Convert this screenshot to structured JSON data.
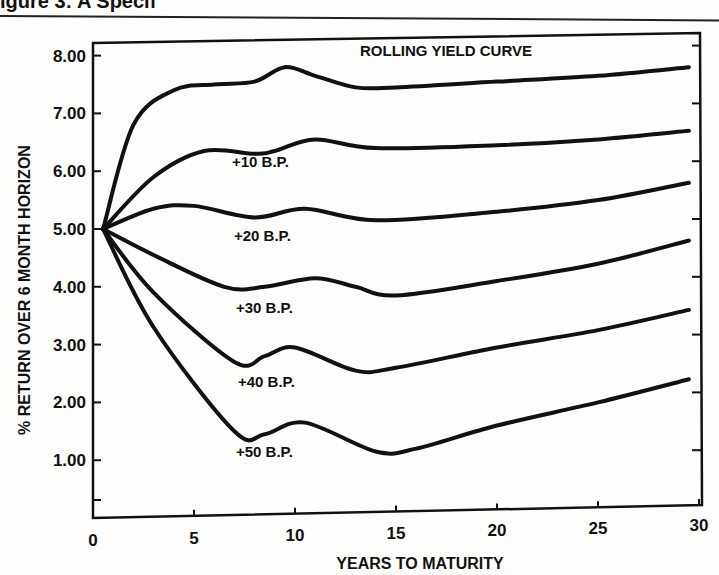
{
  "heading": {
    "text": "igure 3: A Specif"
  },
  "chart_data": {
    "type": "line",
    "title": "",
    "xlabel": "YEARS TO MATURITY",
    "ylabel": "% RETURN OVER 6 MONTH HORIZON",
    "xlim": [
      0,
      30
    ],
    "ylim": [
      0,
      8.5
    ],
    "x_ticks": [
      "0",
      "5",
      "10",
      "15",
      "20",
      "25",
      "30"
    ],
    "y_ticks": [
      "1.00",
      "2.00",
      "3.00",
      "4.00",
      "5.00",
      "6.00",
      "7.00",
      "8.00"
    ],
    "grid": false,
    "legend": "inline labels",
    "series": [
      {
        "name": "ROLLING YIELD CURVE",
        "x": [
          0.5,
          2,
          4,
          6,
          8,
          9.5,
          11,
          13,
          15,
          20,
          25,
          29.5
        ],
        "values": [
          5.0,
          6.8,
          7.4,
          7.5,
          7.55,
          7.8,
          7.65,
          7.45,
          7.45,
          7.55,
          7.65,
          7.8
        ],
        "label_pos": [
          360,
          56
        ]
      },
      {
        "name": "+10 B.P.",
        "x": [
          0.5,
          3,
          5.5,
          8,
          9,
          11,
          14,
          20,
          25,
          29.5
        ],
        "values": [
          5.0,
          5.9,
          6.35,
          6.3,
          6.35,
          6.55,
          6.4,
          6.45,
          6.55,
          6.7
        ],
        "label_pos": [
          232,
          167
        ]
      },
      {
        "name": "+20 B.P.",
        "x": [
          0.5,
          3,
          5,
          8,
          10.5,
          14,
          20,
          25,
          29.5
        ],
        "values": [
          5.0,
          5.35,
          5.4,
          5.2,
          5.35,
          5.15,
          5.3,
          5.5,
          5.8
        ],
        "label_pos": [
          234,
          241
        ]
      },
      {
        "name": "+30 B.P.",
        "x": [
          0.5,
          3,
          6.5,
          8.5,
          11,
          13,
          15,
          20,
          25,
          29.5
        ],
        "values": [
          5.0,
          4.55,
          4.0,
          4.0,
          4.15,
          4.0,
          3.85,
          4.1,
          4.4,
          4.8
        ],
        "label_pos": [
          236,
          313
        ]
      },
      {
        "name": "+40 B.P.",
        "x": [
          0.5,
          3,
          7,
          8.5,
          10,
          13,
          15,
          20,
          25,
          29.5
        ],
        "values": [
          5.0,
          3.9,
          2.7,
          2.8,
          2.95,
          2.55,
          2.6,
          2.95,
          3.25,
          3.6
        ],
        "label_pos": [
          238,
          387
        ]
      },
      {
        "name": "+50 B.P.",
        "x": [
          0.5,
          3,
          7,
          8.5,
          10.5,
          14,
          16,
          20,
          25,
          29.5
        ],
        "values": [
          5.0,
          3.3,
          1.5,
          1.45,
          1.65,
          1.15,
          1.2,
          1.6,
          2.0,
          2.4
        ],
        "label_pos": [
          236,
          457
        ]
      }
    ]
  }
}
